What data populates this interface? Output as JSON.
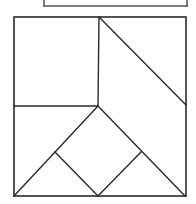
{
  "diagram": {
    "type": "tangram-like geometric dissection",
    "colors": {
      "background": "#ffffff",
      "stroke": "#2a2a2a",
      "stroke_top": "#555555"
    },
    "top_fragment": {
      "description": "partial box cut off at top edge",
      "segments": [
        {
          "x1": 44,
          "y1": 0,
          "x2": 44,
          "y2": 6
        },
        {
          "x1": 44,
          "y1": 6,
          "x2": 187,
          "y2": 6
        },
        {
          "x1": 187,
          "y1": 0,
          "x2": 187,
          "y2": 6
        }
      ]
    },
    "outer_square": {
      "x": 14,
      "y": 17,
      "width": 172,
      "height": 179
    },
    "segments": [
      {
        "name": "upper-vertical-divider",
        "x1": 99,
        "y1": 17,
        "x2": 98,
        "y2": 106
      },
      {
        "name": "mid-horizontal-left",
        "x1": 14,
        "y1": 106,
        "x2": 98,
        "y2": 106
      },
      {
        "name": "upper-right-diagonal",
        "x1": 99,
        "y1": 17,
        "x2": 186,
        "y2": 105
      },
      {
        "name": "apex-to-bottom-left",
        "x1": 98,
        "y1": 106,
        "x2": 14,
        "y2": 196
      },
      {
        "name": "apex-to-bottom-right",
        "x1": 98,
        "y1": 106,
        "x2": 185,
        "y2": 196
      },
      {
        "name": "left-inner-to-bottom-mid",
        "x1": 55,
        "y1": 152,
        "x2": 98,
        "y2": 196
      },
      {
        "name": "right-inner-to-bottom-mid",
        "x1": 141,
        "y1": 152,
        "x2": 98,
        "y2": 196
      }
    ]
  }
}
